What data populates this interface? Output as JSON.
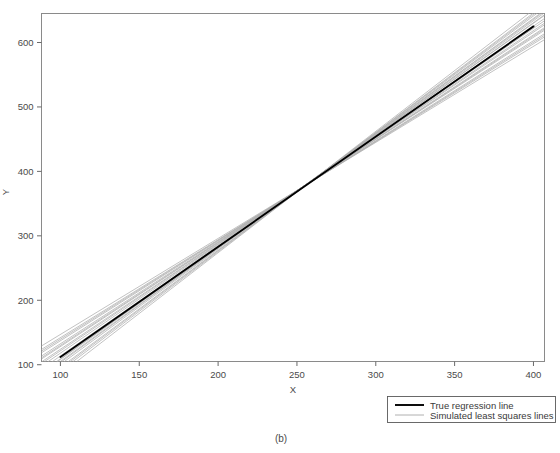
{
  "chart_data": {
    "type": "line",
    "title": "",
    "subtitle": "",
    "xlabel": "X",
    "ylabel": "Y",
    "xlim": [
      88,
      407
    ],
    "ylim": [
      105,
      645
    ],
    "xticks": [
      100,
      150,
      200,
      250,
      300,
      350,
      400
    ],
    "xticklabels": [
      "100",
      "150",
      "200",
      "250",
      "300",
      "350",
      "400"
    ],
    "yticks": [
      100,
      200,
      300,
      400,
      500,
      600
    ],
    "yticklabels": [
      "100",
      "200",
      "300",
      "400",
      "500",
      "600"
    ],
    "grid": false,
    "legend_position": "below-right",
    "annotations": [
      "(b)"
    ],
    "series": [
      {
        "name": "True regression line",
        "role": "true-line",
        "color": "#000000",
        "width": 1.9,
        "intercept": -59.0,
        "slope": 1.71,
        "x": [
          100,
          400
        ],
        "y": [
          112,
          625
        ]
      },
      {
        "name": "Simulated least squares lines",
        "role": "simulated-lines",
        "color": "#aeaeae",
        "width": 0.8,
        "count": 20,
        "pivot_x": 247,
        "pivot_y": 363,
        "lines": [
          {
            "intercept": -86.0,
            "slope": 1.818
          },
          {
            "intercept": -78.5,
            "slope": 1.79
          },
          {
            "intercept": -71.0,
            "slope": 1.762
          },
          {
            "intercept": -64.5,
            "slope": 1.736
          },
          {
            "intercept": -40.0,
            "slope": 1.64
          },
          {
            "intercept": -33.0,
            "slope": 1.612
          },
          {
            "intercept": -26.0,
            "slope": 1.585
          },
          {
            "intercept": -18.0,
            "slope": 1.552
          },
          {
            "intercept": -95.0,
            "slope": 1.852
          },
          {
            "intercept": -57.0,
            "slope": 1.706
          },
          {
            "intercept": -50.0,
            "slope": 1.68
          },
          {
            "intercept": -10.0,
            "slope": 1.52
          },
          {
            "intercept": -103.0,
            "slope": 1.884
          },
          {
            "intercept": -44.0,
            "slope": 1.656
          },
          {
            "intercept": -66.0,
            "slope": 1.742
          },
          {
            "intercept": -2.0,
            "slope": 1.49
          },
          {
            "intercept": -90.0,
            "slope": 1.834
          },
          {
            "intercept": -30.0,
            "slope": 1.6
          },
          {
            "intercept": -74.0,
            "slope": 1.775
          },
          {
            "intercept": -14.0,
            "slope": 1.536
          }
        ]
      }
    ]
  },
  "legend": {
    "entries": [
      {
        "label": "True regression line",
        "swatch": "true-line-swatch"
      },
      {
        "label": "Simulated least squares lines",
        "swatch": "simulated-line-swatch"
      }
    ]
  },
  "caption": {
    "text": "(b)"
  },
  "colors": {
    "frame": "#8a8a8a",
    "true_line": "#000000",
    "simulated_line": "#b0b0b0",
    "text": "#3a3a3a",
    "background": "#ffffff"
  }
}
